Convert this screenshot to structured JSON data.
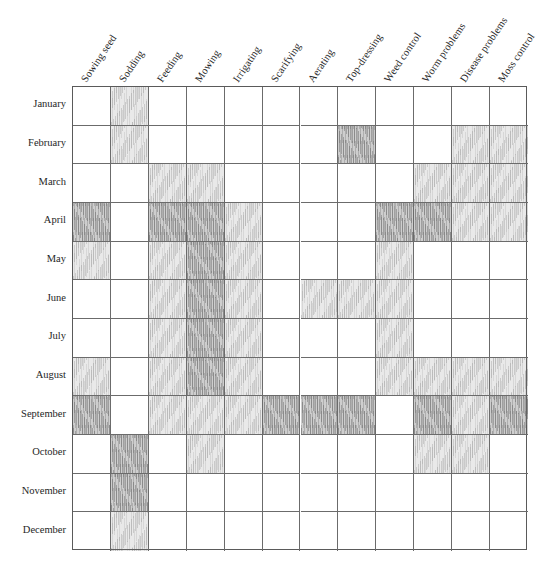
{
  "chart_data": {
    "type": "heatmap",
    "xlabel": "",
    "ylabel": "",
    "legend_position": "none",
    "grid": true,
    "intensity_levels": [
      0,
      1,
      2
    ],
    "intensity_meaning": {
      "0": "not applicable",
      "1": "possible / secondary period",
      "2": "main / best period"
    },
    "colors": {
      "grid_line": "#6b6b6b",
      "border": "#5a5a5a",
      "text": "#262626",
      "shade_light": "#cfcfcf",
      "shade_dark": "#a8a8a8",
      "background": "#ffffff"
    },
    "categories": [
      "Sowing seed",
      "Sodding",
      "Feeding",
      "Mowing",
      "Irrigating",
      "Scarifying",
      "Aerating",
      "Top-dressing",
      "Weed control",
      "Worm problems",
      "Disease problems",
      "Moss control"
    ],
    "rows": [
      "January",
      "February",
      "March",
      "April",
      "May",
      "June",
      "July",
      "August",
      "September",
      "October",
      "November",
      "December"
    ],
    "values": [
      [
        0,
        1,
        0,
        0,
        0,
        0,
        0,
        0,
        0,
        0,
        0,
        0
      ],
      [
        0,
        1,
        0,
        0,
        0,
        0,
        0,
        2,
        0,
        0,
        1,
        1
      ],
      [
        0,
        0,
        1,
        1,
        0,
        0,
        0,
        0,
        0,
        1,
        1,
        1
      ],
      [
        2,
        0,
        2,
        2,
        1,
        0,
        0,
        0,
        2,
        2,
        1,
        1
      ],
      [
        1,
        0,
        1,
        2,
        1,
        0,
        0,
        0,
        1,
        0,
        0,
        0
      ],
      [
        0,
        0,
        1,
        2,
        1,
        0,
        1,
        1,
        1,
        0,
        0,
        0
      ],
      [
        0,
        0,
        1,
        2,
        1,
        0,
        0,
        0,
        1,
        0,
        0,
        0
      ],
      [
        1,
        0,
        1,
        2,
        1,
        0,
        0,
        0,
        1,
        1,
        1,
        1
      ],
      [
        2,
        0,
        1,
        1,
        1,
        2,
        2,
        2,
        0,
        2,
        1,
        2
      ],
      [
        0,
        2,
        0,
        1,
        0,
        0,
        0,
        0,
        0,
        1,
        1,
        0
      ],
      [
        0,
        2,
        0,
        0,
        0,
        0,
        0,
        0,
        0,
        0,
        0,
        0
      ],
      [
        0,
        1,
        0,
        0,
        0,
        0,
        0,
        0,
        0,
        0,
        0,
        0
      ]
    ]
  }
}
